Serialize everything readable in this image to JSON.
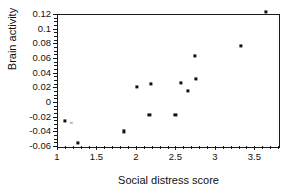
{
  "chart_data": {
    "type": "scatter",
    "title": "",
    "xlabel": "Social distress score",
    "ylabel": "Brain activity",
    "xlim": [
      1,
      3.8
    ],
    "ylim": [
      -0.06,
      0.12
    ],
    "grid": false,
    "legend": null,
    "xticks": [
      1,
      1.5,
      2,
      2.5,
      3,
      3.5
    ],
    "xtick_labels": [
      "1",
      "1.5",
      "2",
      "2.5",
      "3",
      "3.5"
    ],
    "xminor_step": 0.1,
    "yticks": [
      0.12,
      0.1,
      0.08,
      0.06,
      0.04,
      0.02,
      0,
      -0.02,
      -0.04,
      -0.06
    ],
    "ytick_labels": [
      "0.12",
      "0.1",
      "0.08",
      "0.06",
      "0.04",
      "0.02",
      "0",
      "-0.02",
      "-0.04",
      "-0.06"
    ],
    "yminor_step": 0.005,
    "marker": "square",
    "marker_color": "#111111",
    "points": [
      {
        "x": 1.1,
        "y": -0.026,
        "faint": false
      },
      {
        "x": 1.18,
        "y": -0.028,
        "faint": true
      },
      {
        "x": 1.27,
        "y": -0.056,
        "faint": false
      },
      {
        "x": 1.85,
        "y": -0.04,
        "faint": false
      },
      {
        "x": 2.01,
        "y": 0.0205,
        "faint": false
      },
      {
        "x": 2.17,
        "y": -0.018,
        "faint": false
      },
      {
        "x": 2.19,
        "y": 0.0245,
        "faint": false
      },
      {
        "x": 2.5,
        "y": -0.018,
        "faint": false
      },
      {
        "x": 2.57,
        "y": 0.0255,
        "faint": false
      },
      {
        "x": 2.66,
        "y": 0.0155,
        "faint": false
      },
      {
        "x": 2.75,
        "y": 0.063,
        "faint": false
      },
      {
        "x": 2.76,
        "y": 0.032,
        "faint": false
      },
      {
        "x": 3.33,
        "y": 0.077,
        "faint": false
      },
      {
        "x": 3.65,
        "y": 0.123,
        "faint": false
      }
    ]
  }
}
